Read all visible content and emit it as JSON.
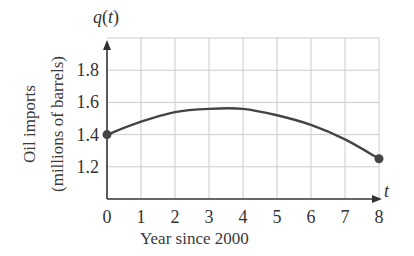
{
  "chart_data": {
    "type": "line",
    "title": "",
    "function_label": "q(t)",
    "function_name": "q",
    "function_var": "t",
    "xlabel": "Year since 2000",
    "xaxis_var": "t",
    "ylabel_line1": "Oil imports",
    "ylabel_line2": "(millions of barrels)",
    "xlim": [
      0,
      8
    ],
    "ylim": [
      1.0,
      2.0
    ],
    "xticks": [
      "0",
      "1",
      "2",
      "3",
      "4",
      "5",
      "6",
      "7",
      "8"
    ],
    "yticks": [
      "1.2",
      "1.4",
      "1.6",
      "1.8"
    ],
    "grid": true,
    "legend": null,
    "series": [
      {
        "name": "q(t)",
        "x": [
          0,
          1,
          2,
          3,
          4,
          5,
          6,
          7,
          8
        ],
        "values": [
          1.4,
          1.48,
          1.54,
          1.56,
          1.56,
          1.52,
          1.46,
          1.37,
          1.25
        ],
        "endpoints": [
          [
            0,
            1.4
          ],
          [
            8,
            1.25
          ]
        ],
        "color": "#444444"
      }
    ],
    "colors": {
      "grid": "#cccccc",
      "axis": "#333333",
      "curve": "#444444"
    }
  }
}
